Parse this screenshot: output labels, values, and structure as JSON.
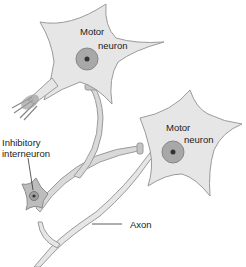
{
  "diagram": {
    "labels": {
      "motor_neuron_top_line1": "Motor",
      "motor_neuron_top_line2": "neuron",
      "motor_neuron_right_line1": "Motor",
      "motor_neuron_right_line2": "neuron",
      "inhibitory_line1": "Inhibitory",
      "inhibitory_line2": "interneuron",
      "axon": "Axon"
    },
    "colors": {
      "cell_fill": "#e6e6e6",
      "cell_stroke": "#9a9a9a",
      "nucleus_fill": "#a8a8a8",
      "nucleolus_fill": "#333333",
      "inter_fill": "#bdbdbd",
      "text": "#222222"
    }
  }
}
